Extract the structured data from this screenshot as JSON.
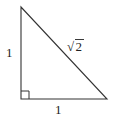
{
  "diagram": {
    "type": "right-triangle",
    "stroke_color": "#333333",
    "background": "#ffffff",
    "vertices": {
      "top": [
        21,
        7
      ],
      "right_angle": [
        21,
        99
      ],
      "bottom_right": [
        107,
        99
      ]
    },
    "labels": {
      "left_side": "1",
      "bottom_side": "1",
      "hypotenuse_radicand": "2",
      "hypotenuse_symbol": "√"
    },
    "right_angle_marker": true
  }
}
